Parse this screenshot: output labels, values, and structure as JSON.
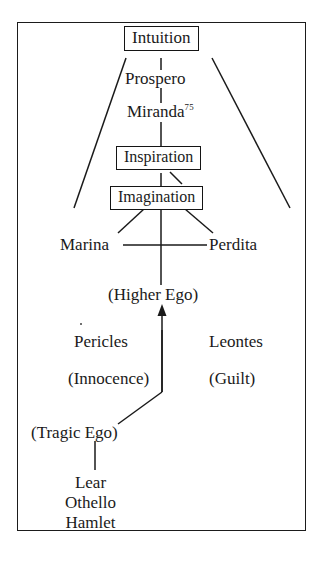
{
  "figure": {
    "border_color": "#1b1b1b",
    "ink_color": "#1a1a1a",
    "background": "#ffffff"
  },
  "nodes": {
    "intuition": {
      "label": "Intuition",
      "boxed": true
    },
    "prospero": {
      "label": "Prospero",
      "boxed": false
    },
    "miranda": {
      "label": "Miranda",
      "footnote": "75",
      "boxed": false
    },
    "inspiration": {
      "label": "Inspiration",
      "boxed": true
    },
    "imagination": {
      "label": "Imagination",
      "boxed": true
    },
    "marina": {
      "label": "Marina",
      "boxed": false
    },
    "perdita": {
      "label": "Perdita",
      "boxed": false
    },
    "higher_ego": {
      "label": "(Higher Ego)",
      "boxed": false
    },
    "pericles": {
      "label": "Pericles",
      "boxed": false
    },
    "leontes": {
      "label": "Leontes",
      "boxed": false
    },
    "innocence": {
      "label": "(Innocence)",
      "boxed": false
    },
    "guilt": {
      "label": "(Guilt)",
      "boxed": false
    },
    "tragic_ego": {
      "label": "(Tragic Ego)",
      "boxed": false
    },
    "tragedies": {
      "line1": "Lear",
      "line2": "Othello",
      "line3": "Hamlet"
    }
  }
}
